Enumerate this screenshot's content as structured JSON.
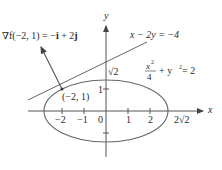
{
  "figure": {
    "gradient_label": {
      "nabla_f": "∇f(−2, 1) = −",
      "i": "i",
      "plus": " + 2",
      "j": "j"
    },
    "tangent_label": "x − 2y = −4",
    "ellipse_label": {
      "num": "x",
      "num_exp": "2",
      "den": "4",
      "rest": "+ y",
      "rest_exp": "2",
      "eq": " = 2"
    },
    "point_label": "(−2, 1)",
    "axis_x_label": "x",
    "axis_y_label": "y",
    "x_ticks": [
      "−2",
      "−1",
      "0",
      "1",
      "2"
    ],
    "x_intercept_label": "2√2",
    "y_tick_label": "1",
    "y_intercept_label": "√2",
    "colors": {
      "axis": "#444444",
      "curve": "#555555",
      "text": "#2a2a2a"
    }
  }
}
